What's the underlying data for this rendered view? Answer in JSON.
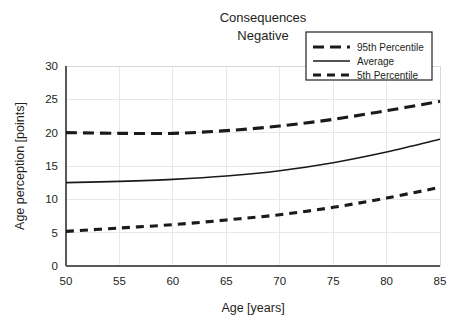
{
  "chart_data": {
    "type": "line",
    "title": "Consequences Negative",
    "title_line1": "Consequences",
    "title_line2": "Negative",
    "xlabel": "Age [years]",
    "ylabel": "Age perception [points]",
    "xlim": [
      50,
      85
    ],
    "ylim": [
      0,
      30
    ],
    "xticks": [
      50,
      55,
      60,
      65,
      70,
      75,
      80,
      85
    ],
    "yticks": [
      0,
      5,
      10,
      15,
      20,
      25,
      30
    ],
    "xtick_labels": [
      "50",
      "55",
      "60",
      "65",
      "70",
      "75",
      "80",
      "85"
    ],
    "ytick_labels": [
      "0",
      "5",
      "10",
      "15",
      "20",
      "25",
      "30"
    ],
    "grid": true,
    "legend_position": "top-right",
    "x": [
      50,
      55,
      60,
      65,
      70,
      75,
      80,
      85
    ],
    "series": [
      {
        "name": "95th Percentile",
        "style": "dashed-long",
        "color": "#1a1a1a",
        "values": [
          20.0,
          19.9,
          19.9,
          20.3,
          21.0,
          22.0,
          23.3,
          24.7
        ]
      },
      {
        "name": "Average",
        "style": "solid",
        "color": "#1a1a1a",
        "values": [
          12.5,
          12.7,
          13.0,
          13.5,
          14.3,
          15.5,
          17.1,
          19.0
        ]
      },
      {
        "name": "5th Percentile",
        "style": "dashed-short",
        "color": "#1a1a1a",
        "values": [
          5.2,
          5.7,
          6.2,
          6.9,
          7.7,
          8.8,
          10.2,
          11.8
        ]
      }
    ]
  },
  "legend": {
    "items": [
      {
        "label": "95th Percentile",
        "style": "dashed-long"
      },
      {
        "label": "Average",
        "style": "solid"
      },
      {
        "label": "5th Percentile",
        "style": "dashed-short"
      }
    ]
  },
  "colors": {
    "line": "#1a1a1a",
    "grid": "#e8e8e8",
    "axis": "#58595b",
    "text": "#231f20",
    "background": "#ffffff"
  }
}
